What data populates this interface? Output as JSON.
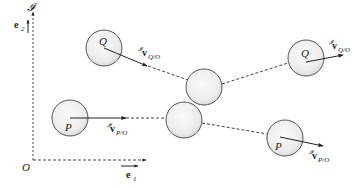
{
  "frame": {
    "label": "𝓘",
    "origin_label": "O",
    "e1": {
      "symbol": "e",
      "subscript": "1"
    },
    "e2": {
      "symbol": "e",
      "subscript": "2"
    }
  },
  "bodies": {
    "q_before": {
      "label": "Q",
      "velocity": {
        "sup": "𝓘",
        "symbol": "v",
        "sub": "Q/O"
      }
    },
    "p_before": {
      "label": "P",
      "velocity": {
        "sup": "𝓘",
        "symbol": "v",
        "sub": "P/O"
      }
    },
    "q_after": {
      "label": "Q",
      "velocity": {
        "sup": "𝓘",
        "symbol": "v",
        "sub": "Q/O"
      }
    },
    "p_after": {
      "label": "P",
      "velocity": {
        "sup": "𝓘",
        "symbol": "v",
        "sub": "P/O"
      }
    },
    "collision_upper": {
      "label": ""
    },
    "collision_lower": {
      "label": ""
    }
  },
  "colors": {
    "stroke": "#555555",
    "line": "#333333",
    "fill_light": "#f7f7f7",
    "fill_dark": "#d8d8d8"
  }
}
